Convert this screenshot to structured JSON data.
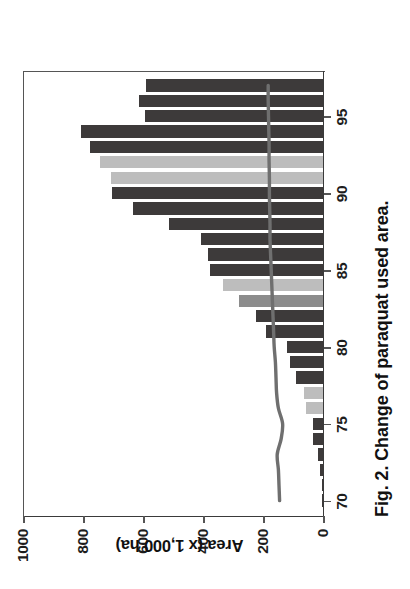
{
  "figure": {
    "caption": "Fig. 2. Change of paraquat used area.",
    "rotation_note": "figure printed rotated 90 degrees counter-clockwise"
  },
  "chart_data": {
    "type": "bar",
    "title": "Fig. 2. Change of paraquat used area.",
    "xlabel": "",
    "ylabel": "Area (x 1,000 ha)",
    "ylim": [
      0,
      1000
    ],
    "yticks": [
      0,
      200,
      400,
      600,
      800,
      1000
    ],
    "xticks": [
      70,
      75,
      80,
      85,
      90,
      95
    ],
    "xlim": [
      69,
      98
    ],
    "grid": false,
    "legend": "none",
    "categories": [
      70,
      71,
      72,
      73,
      74,
      75,
      76,
      77,
      78,
      79,
      80,
      81,
      82,
      83,
      84,
      85,
      86,
      87,
      88,
      89,
      90,
      91,
      92,
      93,
      94,
      95,
      96,
      97
    ],
    "values": [
      3,
      5,
      9,
      18,
      34,
      34,
      58,
      62,
      89,
      111,
      120,
      191,
      222,
      280,
      332,
      378,
      382,
      406,
      514,
      634,
      702,
      708,
      745,
      778,
      806,
      594,
      615,
      591
    ],
    "bar_shades": [
      "dark",
      "dark",
      "dark",
      "dark",
      "dark",
      "dark",
      "light",
      "light",
      "dark",
      "dark",
      "dark",
      "dark",
      "dark",
      "mid",
      "light",
      "dark",
      "dark",
      "dark",
      "dark",
      "dark",
      "dark",
      "light",
      "light",
      "dark",
      "dark",
      "dark",
      "dark",
      "dark"
    ],
    "series": [
      {
        "name": "overlay-line",
        "type": "line",
        "x": [
          70,
          71,
          72,
          73,
          74,
          75,
          76,
          77,
          78,
          79,
          80,
          81,
          82,
          83,
          84,
          85,
          86,
          87,
          88,
          89,
          90,
          91,
          92,
          93,
          94,
          95,
          96,
          97
        ],
        "values": [
          148,
          150,
          152,
          156,
          143,
          138,
          152,
          158,
          160,
          162,
          166,
          168,
          170,
          172,
          174,
          176,
          178,
          180,
          180,
          181,
          182,
          182,
          183,
          183,
          184,
          185,
          186,
          186
        ]
      }
    ],
    "colors": {
      "bar_dark": "#3d3a3a",
      "bar_mid": "#8c8c8c",
      "bar_light": "#bdbdbd",
      "line": "#6f6f6f",
      "axis": "#555555",
      "text": "#111111"
    }
  },
  "axes": {
    "value_axis_labels": [
      "1000",
      "800",
      "600",
      "400",
      "200",
      "0"
    ],
    "category_axis_labels": [
      "70",
      "75",
      "80",
      "85",
      "90",
      "95"
    ],
    "value_axis_title": "Area (x 1,000 ha)"
  }
}
